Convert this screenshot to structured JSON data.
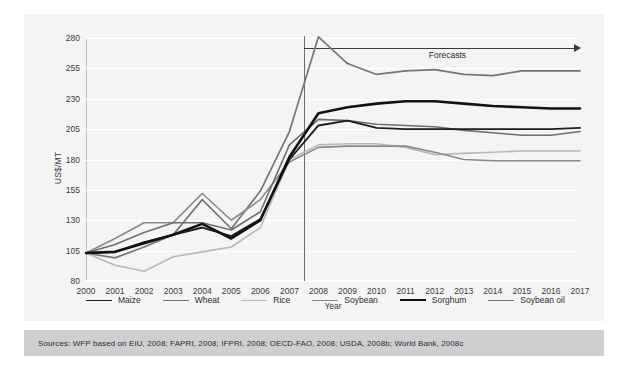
{
  "top_ghost_text": "",
  "chart_data": {
    "type": "line",
    "title": "",
    "xlabel": "Year",
    "ylabel": "US$/MT",
    "xlim": [
      2000,
      2017
    ],
    "ylim": [
      80,
      280
    ],
    "yticks": [
      80,
      105,
      130,
      155,
      180,
      205,
      230,
      255,
      280
    ],
    "grid": true,
    "legend_position": "bottom",
    "x": [
      2000,
      2001,
      2002,
      2003,
      2004,
      2005,
      2006,
      2007,
      2008,
      2009,
      2010,
      2011,
      2012,
      2013,
      2014,
      2015,
      2016,
      2017
    ],
    "categories": [
      "2000",
      "2001",
      "2002",
      "2003",
      "2004",
      "2005",
      "2006",
      "2007",
      "2008",
      "2009",
      "2010",
      "2011",
      "2012",
      "2013",
      "2014",
      "2015",
      "2016",
      "2017"
    ],
    "annotations": [
      {
        "name": "forecast-divider",
        "type": "vline",
        "x": 2007.5
      },
      {
        "name": "forecast-arrow",
        "type": "arrow",
        "label": "Forecasts",
        "x_start": 2007.5,
        "x_end": 2017,
        "y": 272
      }
    ],
    "series": [
      {
        "name": "Maize",
        "color": "#1d1d1f",
        "width": 1.9,
        "values": [
          103,
          104,
          112,
          118,
          124,
          117,
          131,
          180,
          208,
          212,
          206,
          205,
          205,
          205,
          205,
          205,
          205,
          206
        ]
      },
      {
        "name": "Wheat",
        "color": "#6f6f73",
        "width": 1.6,
        "values": [
          103,
          110,
          120,
          128,
          128,
          122,
          137,
          192,
          213,
          212,
          209,
          208,
          207,
          204,
          202,
          200,
          200,
          203
        ]
      },
      {
        "name": "Rice",
        "color": "#b9b9bd",
        "width": 1.6,
        "values": [
          103,
          93,
          88,
          100,
          104,
          108,
          124,
          180,
          192,
          193,
          193,
          190,
          184,
          185,
          186,
          187,
          187,
          187
        ]
      },
      {
        "name": "Soybean",
        "color": "#8a8a8e",
        "width": 1.6,
        "values": [
          103,
          115,
          128,
          128,
          152,
          130,
          147,
          178,
          190,
          191,
          191,
          191,
          186,
          180,
          179,
          179,
          179,
          179
        ]
      },
      {
        "name": "Sorghum",
        "color": "#121214",
        "width": 2.6,
        "values": [
          103,
          104,
          111,
          118,
          127,
          115,
          130,
          182,
          218,
          223,
          226,
          228,
          228,
          226,
          224,
          223,
          222,
          222
        ]
      },
      {
        "name": "Soybean oil",
        "color": "#757579",
        "width": 1.7,
        "values": [
          103,
          99,
          108,
          118,
          147,
          123,
          154,
          203,
          281,
          259,
          250,
          253,
          254,
          250,
          249,
          253,
          253,
          253
        ]
      }
    ]
  },
  "sources": {
    "text": "Sources: WFP based on EIU, 2008; FAPRI, 2008; IFPRI, 2008; OECD-FAO, 2008; USDA, 2008b; World Bank, 2008c"
  }
}
